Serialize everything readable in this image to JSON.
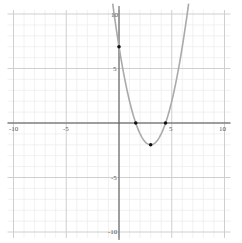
{
  "chart_data": {
    "type": "line",
    "title": "",
    "xlabel": "",
    "ylabel": "",
    "xlim": [
      -10,
      10
    ],
    "ylim": [
      -10,
      10
    ],
    "grid": true,
    "x_ticks": [
      -10,
      -5,
      5,
      10
    ],
    "y_ticks": [
      10,
      5,
      -5,
      -10
    ],
    "tick_labels": {
      "x": [
        "-10",
        "-5",
        "5",
        "10"
      ],
      "y": [
        "10",
        "5",
        "-5",
        "-10"
      ]
    },
    "series": [
      {
        "name": "y = x^2 - 6x + 7",
        "kind": "parabola",
        "coefficients": {
          "a": 1,
          "b": -6,
          "c": 7
        },
        "color": "#aaaaaa"
      }
    ],
    "points": [
      {
        "label": "y-intercept",
        "x": 0,
        "y": 7
      },
      {
        "label": "root-1",
        "x": 1.59,
        "y": 0
      },
      {
        "label": "vertex",
        "x": 3,
        "y": -2
      },
      {
        "label": "root-2",
        "x": 4.41,
        "y": 0
      }
    ]
  },
  "axis_labels": {
    "x_neg10": "-10",
    "x_neg5": "-5",
    "x_5": "5",
    "x_10": "10",
    "y_10": "10",
    "y_5": "5",
    "y_neg5": "-5",
    "y_neg10": "-10"
  }
}
